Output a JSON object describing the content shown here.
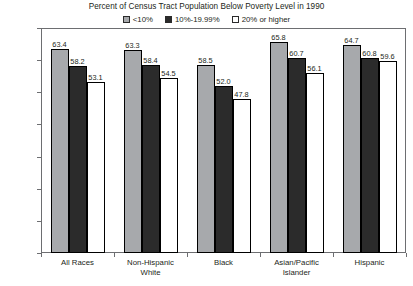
{
  "chart_data": {
    "type": "bar",
    "title": "Percent of Census Tract Population Below Poverty Level in 1990",
    "xlabel": "",
    "ylabel": "Five-Year Cause-Specific Survival Rate (%)",
    "ylim": [
      0.0,
      70.0
    ],
    "ytick_labels": [
      "70.0",
      "60.0",
      "50.0",
      "40.0",
      "30.0",
      "20.0",
      "10.0",
      "0.0"
    ],
    "ytick_values": [
      70.0,
      60.0,
      50.0,
      40.0,
      30.0,
      20.0,
      10.0,
      0.0
    ],
    "grid": false,
    "legend_position": "top-center",
    "categories": [
      "All Races",
      "Non-Hispanic White",
      "Black",
      "Asian/Pacific Islander",
      "Hispanic"
    ],
    "category_lines": [
      [
        "All Races"
      ],
      [
        "Non-Hispanic",
        "White"
      ],
      [
        "Black"
      ],
      [
        "Asian/Pacific",
        "Islander"
      ],
      [
        "Hispanic"
      ]
    ],
    "series": [
      {
        "name": "<10%",
        "color": "#a7a9ac",
        "values": [
          63.4,
          63.3,
          58.5,
          65.8,
          64.7
        ],
        "labels": [
          "63.4",
          "63.3",
          "58.5",
          "65.8",
          "64.7"
        ]
      },
      {
        "name": "10%-19.99%",
        "color": "#2b2b2b",
        "values": [
          58.2,
          58.4,
          52.0,
          60.7,
          60.8
        ],
        "labels": [
          "58.2",
          "58.4",
          "52.0",
          "60.7",
          "60.8"
        ]
      },
      {
        "name": "20% or higher",
        "color": "#ffffff",
        "values": [
          53.1,
          54.5,
          47.8,
          56.1,
          59.6
        ],
        "labels": [
          "53.1",
          "54.5",
          "47.8",
          "56.1",
          "59.6"
        ]
      }
    ]
  },
  "legend": {
    "items": [
      {
        "label": "<10%"
      },
      {
        "label": "10%-19.99%"
      },
      {
        "label": "20% or higher"
      }
    ]
  },
  "colors": {
    "series_low": "#a7a9ac",
    "series_mid": "#2b2b2b",
    "series_high": "#ffffff",
    "axis": "#6d6e71",
    "text": "#231f20"
  }
}
